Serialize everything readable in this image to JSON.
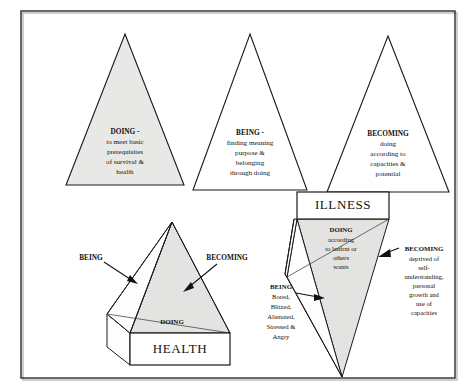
{
  "figure": {
    "frame_color": "#2b2b2b",
    "fill_color": "#e8e8e6",
    "line_color": "#1a1a1a"
  },
  "top_triangles": [
    {
      "id": "doing",
      "filled": true,
      "heading": "DOING -",
      "lines": [
        "to meet basic",
        "prerequisites",
        "of survival &",
        "health"
      ]
    },
    {
      "id": "being",
      "filled": false,
      "heading": "BEING -",
      "lines": [
        "finding meaning",
        "purpose &",
        "belonging",
        "through doing"
      ]
    },
    {
      "id": "becoming",
      "filled": false,
      "heading": "BECOMING",
      "lines": [
        "doing",
        "according to",
        "capacities &",
        "potential"
      ]
    }
  ],
  "health_pyramid": {
    "base_label": "HEALTH",
    "doing_label": "DOING",
    "being_label": "BEING",
    "becoming_label": "BECOMING"
  },
  "illness_pyramid": {
    "base_label": "ILLNESS",
    "doing": {
      "heading": "DOING",
      "lines": [
        "according",
        "to lanfrnt or",
        "others",
        "wants"
      ]
    },
    "being": {
      "heading": "BEING",
      "lines": [
        "Bored,",
        "Blitzed,",
        "Alienated,",
        "Stressed &",
        "Angry"
      ]
    },
    "becoming": {
      "heading": "BECOMING",
      "lines": [
        "deprived of",
        "self-",
        "understanding,",
        "personal",
        "growth and",
        "use of",
        "capacities"
      ]
    }
  }
}
